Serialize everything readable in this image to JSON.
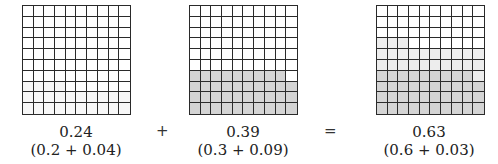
{
  "figure": {
    "operators": {
      "plus": "+",
      "equals": "="
    },
    "panels": [
      {
        "value": "0.24",
        "expansion": "(0.2 + 0.04)",
        "shaded_cells": 24,
        "shade": "faint"
      },
      {
        "value": "0.39",
        "expansion": "(0.3 + 0.09)",
        "shaded_cells": 39,
        "shade": "dark"
      },
      {
        "value": "0.63",
        "expansion": "(0.6 + 0.03)",
        "shaded_cells": 63,
        "shade": "dark+light"
      }
    ],
    "grid": {
      "rows": 10,
      "cols": 10
    },
    "colors": {
      "line": "#2a2a2a",
      "dark_fill": "#d4d4d4",
      "light_fill": "#ededed",
      "faint_fill": "#f7f7f7"
    }
  }
}
